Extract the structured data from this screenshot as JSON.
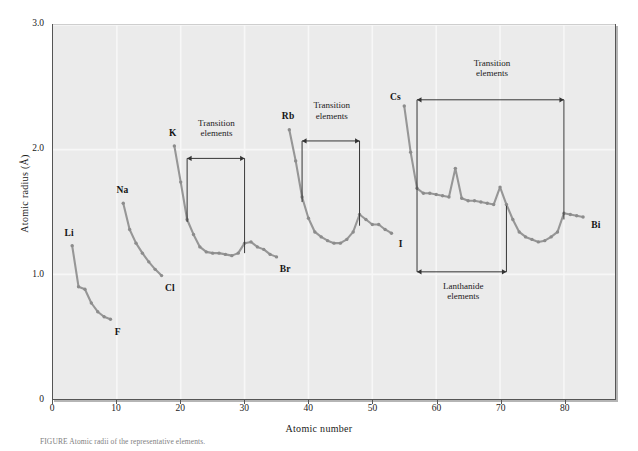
{
  "figure": {
    "caption": "FIGURE  Atomic radii of the representative elements."
  },
  "chart_data": {
    "type": "line",
    "title": "",
    "xlabel": "Atomic number",
    "ylabel": "Atomic radius (Å)",
    "xlim": [
      0,
      88
    ],
    "ylim": [
      0,
      3.0
    ],
    "xticks": [
      0,
      10,
      20,
      30,
      40,
      50,
      60,
      70,
      80
    ],
    "xtick_labels": [
      "0",
      "10",
      "20",
      "30",
      "40",
      "50",
      "60",
      "70",
      "80"
    ],
    "yticks": [
      0,
      1.0,
      2.0,
      3.0
    ],
    "ytick_labels": [
      "0",
      "1.0",
      "2.0",
      "3.0"
    ],
    "grid": true,
    "grid_color": "#f7f7f7",
    "plot_bgcolor": "#ebebeb",
    "line_color": "#969696",
    "marker_color": "#8c8c8c",
    "frame_color": "#555555",
    "legend": "none",
    "series": [
      {
        "name": "period-2",
        "start_label": "Li",
        "end_label": "F",
        "x": [
          3,
          4,
          5,
          6,
          7,
          8,
          9
        ],
        "y": [
          1.23,
          0.9,
          0.88,
          0.77,
          0.7,
          0.66,
          0.64
        ]
      },
      {
        "name": "period-3",
        "start_label": "Na",
        "end_label": "Cl",
        "x": [
          11,
          12,
          13,
          14,
          15,
          16,
          17
        ],
        "y": [
          1.57,
          1.36,
          1.25,
          1.17,
          1.1,
          1.04,
          0.99
        ]
      },
      {
        "name": "period-4",
        "start_label": "K",
        "end_label": "Br",
        "x": [
          19,
          20,
          21,
          22,
          23,
          24,
          25,
          26,
          27,
          28,
          29,
          30,
          31,
          32,
          33,
          34,
          35
        ],
        "y": [
          2.03,
          1.74,
          1.44,
          1.32,
          1.22,
          1.18,
          1.17,
          1.17,
          1.16,
          1.15,
          1.17,
          1.25,
          1.26,
          1.22,
          1.2,
          1.16,
          1.14
        ]
      },
      {
        "name": "period-5",
        "start_label": "Rb",
        "end_label": "I",
        "x": [
          37,
          38,
          39,
          40,
          41,
          42,
          43,
          44,
          45,
          46,
          47,
          48,
          49,
          50,
          51,
          52,
          53
        ],
        "y": [
          2.16,
          1.91,
          1.62,
          1.45,
          1.34,
          1.3,
          1.27,
          1.25,
          1.25,
          1.28,
          1.34,
          1.48,
          1.44,
          1.4,
          1.4,
          1.36,
          1.33
        ]
      },
      {
        "name": "period-6",
        "start_label": "Cs",
        "end_label": "Bi",
        "x": [
          55,
          56,
          57,
          58,
          59,
          60,
          61,
          62,
          63,
          64,
          65,
          66,
          67,
          68,
          69,
          70,
          71,
          72,
          73,
          74,
          75,
          76,
          77,
          78,
          79,
          80,
          81,
          82,
          83
        ],
        "y": [
          2.35,
          1.98,
          1.69,
          1.65,
          1.65,
          1.64,
          1.63,
          1.62,
          1.85,
          1.61,
          1.59,
          1.59,
          1.58,
          1.57,
          1.56,
          1.7,
          1.56,
          1.44,
          1.34,
          1.3,
          1.28,
          1.26,
          1.27,
          1.3,
          1.34,
          1.49,
          1.48,
          1.47,
          1.46
        ]
      }
    ],
    "point_labels": [
      {
        "text": "Li",
        "x": 3,
        "y": 1.23,
        "dx": -3,
        "dy": -14
      },
      {
        "text": "F",
        "x": 9,
        "y": 0.64,
        "dx": 7,
        "dy": 11
      },
      {
        "text": "Na",
        "x": 11,
        "y": 1.57,
        "dx": -1,
        "dy": -14
      },
      {
        "text": "Cl",
        "x": 17,
        "y": 0.99,
        "dx": 8,
        "dy": 11
      },
      {
        "text": "K",
        "x": 19,
        "y": 2.03,
        "dx": -2,
        "dy": -14
      },
      {
        "text": "Br",
        "x": 35,
        "y": 1.14,
        "dx": 8,
        "dy": 11
      },
      {
        "text": "Rb",
        "x": 37,
        "y": 2.16,
        "dx": -2,
        "dy": -14
      },
      {
        "text": "I",
        "x": 53,
        "y": 1.33,
        "dx": 8,
        "dy": 10
      },
      {
        "text": "Cs",
        "x": 55,
        "y": 2.35,
        "dx": -10,
        "dy": -9
      },
      {
        "text": "Bi",
        "x": 83,
        "y": 1.46,
        "dx": 11,
        "dy": 7
      }
    ],
    "annotations": [
      {
        "name": "transition-elements-period-4",
        "text": "Transition\nelements",
        "x_start": 21,
        "x_end": 30,
        "bar_y": 1.93,
        "tick_bottom_start": 1.42,
        "tick_bottom_end": 1.17,
        "text_x": 25.5,
        "text_y": 2.22
      },
      {
        "name": "transition-elements-period-5",
        "text": "Transition\nelements",
        "x_start": 39,
        "x_end": 48,
        "bar_y": 2.07,
        "tick_bottom_start": 1.58,
        "tick_bottom_end": 1.39,
        "text_x": 43.5,
        "text_y": 2.36
      },
      {
        "name": "transition-elements-period-6",
        "text": "Transition\nelements",
        "x_start": 57,
        "x_end": 80,
        "bar_y": 2.4,
        "tick_bottom_start": 1.66,
        "tick_bottom_end": 1.44,
        "text_x": 68.5,
        "text_y": 2.7
      },
      {
        "name": "lanthanide-elements",
        "text": "Lanthanide\nelements",
        "x_start": 57,
        "x_end": 71,
        "bar_y": 1.02,
        "tick_top_start": 1.66,
        "tick_top_end": 1.55,
        "text_x": 64,
        "text_y": 0.92
      }
    ]
  }
}
